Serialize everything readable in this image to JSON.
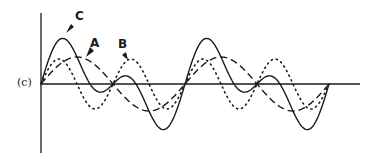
{
  "figure": {
    "panel_label": "(c)",
    "curves": [
      {
        "id": "A",
        "label": "A",
        "style": "dashed",
        "description": "fundamental wave"
      },
      {
        "id": "B",
        "label": "B",
        "style": "dotted",
        "description": "second harmonic wave"
      },
      {
        "id": "C",
        "label": "C",
        "style": "solid",
        "description": "resultant (A + B)"
      }
    ],
    "colors": {
      "ink": "#1a1a1a",
      "background": "#ffffff"
    }
  }
}
